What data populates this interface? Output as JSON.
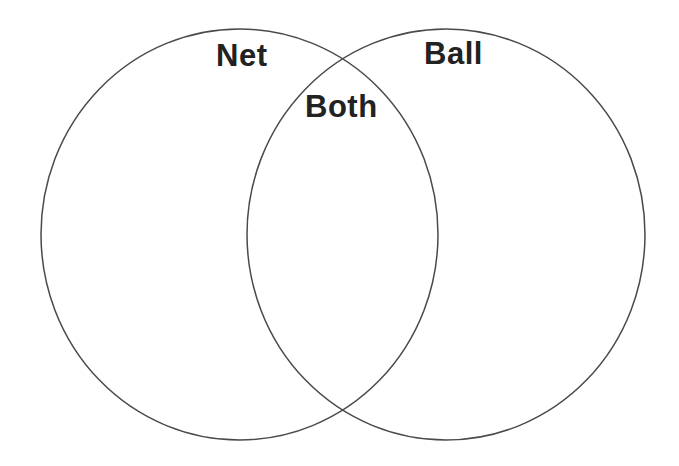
{
  "diagram": {
    "type": "venn",
    "sets": [
      {
        "id": "left",
        "label": "Net"
      },
      {
        "id": "right",
        "label": "Ball"
      }
    ],
    "intersection": {
      "label": "Both"
    },
    "colors": {
      "stroke": "#4a4a4a",
      "label": "#222222",
      "background": "#ffffff"
    }
  }
}
